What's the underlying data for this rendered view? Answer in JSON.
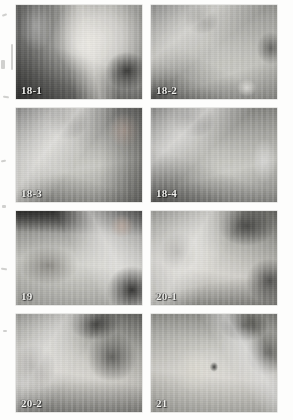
{
  "plate": {
    "layout": "2 columns x 4 rows",
    "panel_count": 8
  },
  "panels": [
    {
      "label": "18-1"
    },
    {
      "label": "18-2"
    },
    {
      "label": "18-3"
    },
    {
      "label": "18-4"
    },
    {
      "label": "19"
    },
    {
      "label": "20-1"
    },
    {
      "label": "20-2"
    },
    {
      "label": "21"
    }
  ]
}
